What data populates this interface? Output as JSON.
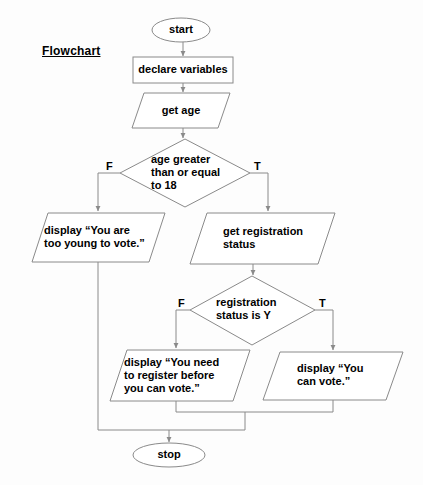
{
  "diagram": {
    "title": "Flowchart",
    "background_color": "#fdfdfd",
    "stroke_color": "#8a8a8a",
    "text_color": "#000000",
    "nodes": {
      "start": {
        "label": "start",
        "shape": "terminator"
      },
      "declare": {
        "label": "declare variables",
        "shape": "process"
      },
      "get_age": {
        "label": "get age",
        "shape": "input-output"
      },
      "age_decision": {
        "label": "age greater\nthan or equal\nto 18",
        "shape": "decision"
      },
      "too_young": {
        "label": "display “You are\ntoo young to vote.”",
        "shape": "input-output"
      },
      "get_registration": {
        "label": "get registration\nstatus",
        "shape": "input-output"
      },
      "registration_decision": {
        "label": "registration\nstatus is Y",
        "shape": "decision"
      },
      "need_register": {
        "label": "display “You need\nto register before\nyou can vote.”",
        "shape": "input-output"
      },
      "can_vote": {
        "label": "display “You\ncan vote.”",
        "shape": "input-output"
      },
      "stop": {
        "label": "stop",
        "shape": "terminator"
      }
    },
    "branch_labels": {
      "age_false": "F",
      "age_true": "T",
      "registration_false": "F",
      "registration_true": "T"
    }
  }
}
